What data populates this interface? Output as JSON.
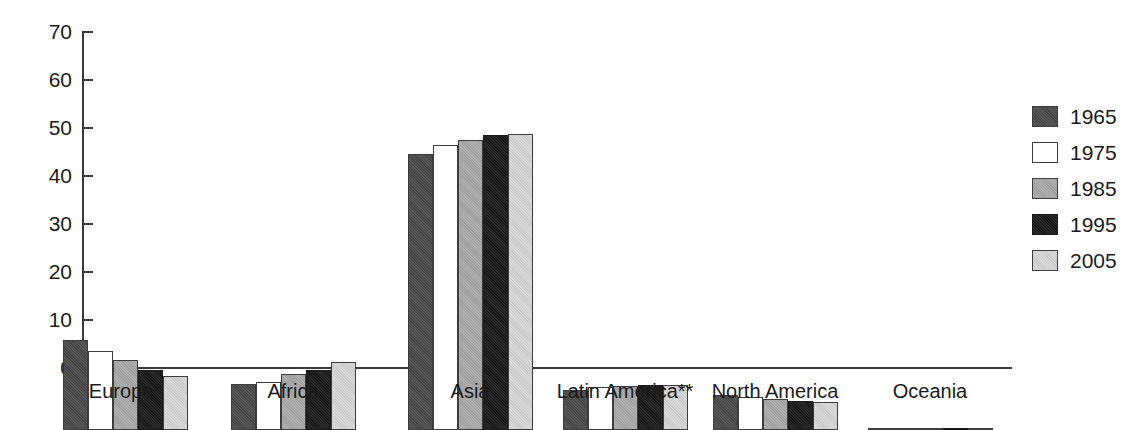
{
  "chart_data": {
    "type": "bar",
    "title": "",
    "subtitle": "",
    "xlabel": "",
    "ylabel": "",
    "ylim": [
      0,
      70
    ],
    "yticks": [
      0,
      10,
      20,
      30,
      40,
      50,
      60,
      70
    ],
    "grid": false,
    "legend_position": "right",
    "categories": [
      "Europe*",
      "Africa",
      "Asia",
      "Latin America**",
      "North America",
      "Oceania"
    ],
    "series": [
      {
        "name": "1965",
        "color": "#4a4a4a",
        "values": [
          18.7,
          9.5,
          57.5,
          8.3,
          7.2,
          0.5
        ]
      },
      {
        "name": "1975",
        "color": "#ffffff",
        "values": [
          16.4,
          10.1,
          59.3,
          8.9,
          6.8,
          0.5
        ]
      },
      {
        "name": "1985",
        "color": "#a9a9a9",
        "values": [
          14.5,
          11.6,
          60.5,
          9.2,
          6.4,
          0.5
        ]
      },
      {
        "name": "1995",
        "color": "#1a1a1a",
        "values": [
          12.6,
          12.5,
          61.4,
          9.3,
          6.0,
          0.5
        ]
      },
      {
        "name": "2005",
        "color": "#d6d6d6",
        "values": [
          11.2,
          14.1,
          61.6,
          9.4,
          5.8,
          0.5
        ]
      }
    ]
  },
  "axis": {
    "tick_labels": [
      "70",
      "60",
      "50",
      "40",
      "30",
      "20",
      "10",
      "0"
    ]
  },
  "legend": {
    "entries": [
      {
        "label": "1965"
      },
      {
        "label": "1975"
      },
      {
        "label": "1985"
      },
      {
        "label": "1995"
      },
      {
        "label": "2005"
      }
    ]
  }
}
